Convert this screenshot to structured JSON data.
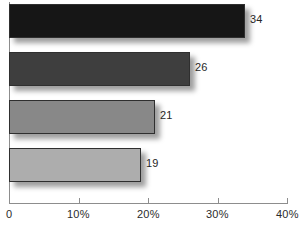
{
  "chart_data": {
    "type": "bar",
    "orientation": "horizontal",
    "title": "",
    "subtitle": "",
    "xlabel": "",
    "ylabel": "",
    "grid": false,
    "legend": false,
    "categories": [
      "",
      "",
      "",
      ""
    ],
    "values": [
      34,
      26,
      21,
      19
    ],
    "value_labels": [
      "34",
      "26",
      "21",
      "19"
    ],
    "xlim": [
      0,
      40
    ],
    "xticks": [
      0,
      10,
      20,
      30,
      40
    ],
    "xtick_labels": [
      "0",
      "10%",
      "20%",
      "30%",
      "40%"
    ],
    "bars": [
      {
        "label": "34",
        "value": 34,
        "color": "#161616"
      },
      {
        "label": "26",
        "value": 26,
        "color": "#3e3e3e"
      },
      {
        "label": "21",
        "value": 21,
        "color": "#888888"
      },
      {
        "label": "19",
        "value": 19,
        "color": "#adadad"
      }
    ],
    "colors": [
      "#161616",
      "#3e3e3e",
      "#888888",
      "#adadad"
    ],
    "axis_color": "#8d8d8d",
    "bar_border_color": "#2f2f2f",
    "background": "#ffffff"
  }
}
